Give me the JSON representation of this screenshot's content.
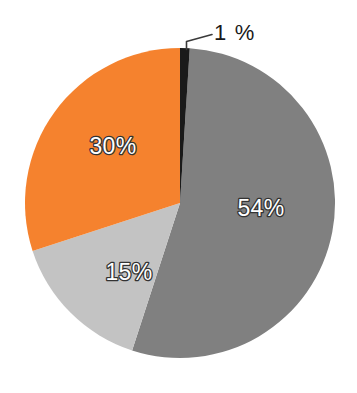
{
  "chart_data": {
    "type": "pie",
    "title": "",
    "subtitle": "",
    "xlabel": "",
    "ylabel": "",
    "legend_position": "none",
    "grid": false,
    "categories": [
      "54%",
      "30%",
      "15%",
      "1%"
    ],
    "values": [
      54,
      30,
      15,
      1
    ],
    "value_unit": "%",
    "slices": [
      {
        "label": "54%",
        "value": 54,
        "color": "#808080",
        "label_color": "#ffffff",
        "label_outline": "#333333",
        "label_placement": "inside",
        "start_angle_deg": 3.6,
        "end_angle_deg": 198.0
      },
      {
        "label": "15%",
        "value": 15,
        "color": "#c3c3c3",
        "label_color": "#ffffff",
        "label_outline": "#333333",
        "label_placement": "inside",
        "start_angle_deg": 198.0,
        "end_angle_deg": 252.0
      },
      {
        "label": "30%",
        "value": 30,
        "color": "#f5822e",
        "label_color": "#ffffff",
        "label_outline": "#333333",
        "label_placement": "inside",
        "start_angle_deg": 252.0,
        "end_angle_deg": 360.0
      },
      {
        "label": "1 %",
        "value": 1,
        "color": "#1a1a1a",
        "label_color": "#1a1a1a",
        "label_outline": "none",
        "label_placement": "callout",
        "start_angle_deg": 0.0,
        "end_angle_deg": 3.6
      }
    ],
    "labels": {
      "slice_54": "54%",
      "slice_30": "30%",
      "slice_15": "15%",
      "slice_1": "1 %"
    },
    "geometry": {
      "center_x": 180,
      "center_y": 203,
      "radius": 155,
      "start_at_deg": 0
    },
    "colors": {
      "background": "#ffffff",
      "dark_gray": "#808080",
      "light_gray": "#c3c3c3",
      "orange": "#f5822e",
      "near_black": "#1a1a1a",
      "leader_line": "#3a3a3a"
    }
  }
}
